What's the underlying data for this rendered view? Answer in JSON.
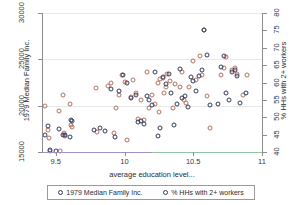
{
  "chart_data": {
    "type": "scatter",
    "title": "",
    "xlabel": "average education level...",
    "ylabel": "1979 Median Family Inc.",
    "ylabel_right": "% HHs with 2+ workers",
    "xlim": [
      9.4,
      11.0
    ],
    "ylim_left": [
      15000,
      30000
    ],
    "ylim_right": [
      40,
      80
    ],
    "grid": true,
    "legend_position": "below-axis",
    "xticks": [
      "9.5",
      "10",
      "10.5",
      "11"
    ],
    "xtick_values": [
      9.5,
      10,
      10.5,
      11
    ],
    "yticks_left": [
      "15000",
      "20000",
      "25000",
      "30000"
    ],
    "ytick_values_left": [
      15000,
      20000,
      25000,
      30000
    ],
    "yticks_right": [
      "40",
      "45",
      "50",
      "55",
      "60",
      "65",
      "70",
      "75",
      "80"
    ],
    "ytick_values_right": [
      40,
      45,
      50,
      55,
      60,
      65,
      70,
      75,
      80
    ],
    "series": [
      {
        "name": "1979 Median Family Inc.",
        "color": "#b5705c",
        "axis": "left",
        "marker": "open-circle",
        "points": [
          [
            9.42,
            19950
          ],
          [
            9.44,
            17400
          ],
          [
            9.45,
            16500
          ],
          [
            9.46,
            15100
          ],
          [
            9.52,
            19400
          ],
          [
            9.53,
            15100
          ],
          [
            9.55,
            21200
          ],
          [
            9.56,
            17000
          ],
          [
            9.57,
            16700
          ],
          [
            9.6,
            20200
          ],
          [
            9.61,
            17900
          ],
          [
            9.62,
            17700
          ],
          [
            9.79,
            21900
          ],
          [
            9.8,
            17200
          ],
          [
            9.88,
            22100
          ],
          [
            9.9,
            22400
          ],
          [
            9.92,
            17100
          ],
          [
            9.94,
            19700
          ],
          [
            9.96,
            21200
          ],
          [
            9.98,
            23300
          ],
          [
            10.0,
            22600
          ],
          [
            10.02,
            16300
          ],
          [
            10.05,
            20900
          ],
          [
            10.06,
            22800
          ],
          [
            10.08,
            21400
          ],
          [
            10.1,
            18600
          ],
          [
            10.12,
            20600
          ],
          [
            10.14,
            18500
          ],
          [
            10.16,
            23600
          ],
          [
            10.18,
            19700
          ],
          [
            10.2,
            21200
          ],
          [
            10.22,
            20200
          ],
          [
            10.24,
            22500
          ],
          [
            10.25,
            19300
          ],
          [
            10.26,
            22900
          ],
          [
            10.28,
            23000
          ],
          [
            10.29,
            21400
          ],
          [
            10.3,
            22000
          ],
          [
            10.31,
            23400
          ],
          [
            10.33,
            22700
          ],
          [
            10.35,
            19700
          ],
          [
            10.37,
            22300
          ],
          [
            10.4,
            22000
          ],
          [
            10.42,
            23600
          ],
          [
            10.43,
            20600
          ],
          [
            10.45,
            20300
          ],
          [
            10.47,
            22000
          ],
          [
            10.5,
            24800
          ],
          [
            10.52,
            22800
          ],
          [
            10.55,
            25400
          ],
          [
            10.56,
            23300
          ],
          [
            10.58,
            28200
          ],
          [
            10.6,
            21000
          ],
          [
            10.62,
            17600
          ],
          [
            10.7,
            23300
          ],
          [
            10.72,
            24100
          ],
          [
            10.74,
            25200
          ],
          [
            10.78,
            23800
          ],
          [
            10.8,
            24100
          ],
          [
            10.82,
            23400
          ],
          [
            10.86,
            21200
          ],
          [
            10.89,
            23300
          ]
        ]
      },
      {
        "name": "% HHs with 2+ workers",
        "color": "#2f3a5c",
        "axis": "right",
        "marker": "open-circle",
        "points": [
          [
            9.42,
            45.0
          ],
          [
            9.44,
            47.5
          ],
          [
            9.46,
            40.5
          ],
          [
            9.5,
            40.3
          ],
          [
            9.52,
            46.5
          ],
          [
            9.55,
            44.8
          ],
          [
            9.57,
            45.0
          ],
          [
            9.6,
            44.2
          ],
          [
            9.61,
            49.3
          ],
          [
            9.62,
            49.0
          ],
          [
            9.78,
            46.4
          ],
          [
            9.82,
            47.0
          ],
          [
            9.86,
            46.0
          ],
          [
            9.9,
            58.2
          ],
          [
            9.93,
            44.2
          ],
          [
            9.96,
            57.5
          ],
          [
            9.99,
            62.3
          ],
          [
            10.02,
            59.8
          ],
          [
            10.05,
            55.6
          ],
          [
            10.08,
            56.5
          ],
          [
            10.1,
            48.5
          ],
          [
            10.12,
            48.8
          ],
          [
            10.14,
            48.0
          ],
          [
            10.16,
            56.2
          ],
          [
            10.18,
            55.0
          ],
          [
            10.2,
            53.5
          ],
          [
            10.22,
            63.0
          ],
          [
            10.24,
            44.5
          ],
          [
            10.26,
            47.0
          ],
          [
            10.28,
            61.5
          ],
          [
            10.3,
            59.5
          ],
          [
            10.32,
            62.5
          ],
          [
            10.34,
            57.0
          ],
          [
            10.36,
            47.8
          ],
          [
            10.38,
            53.8
          ],
          [
            10.4,
            64.0
          ],
          [
            10.42,
            55.4
          ],
          [
            10.44,
            56.0
          ],
          [
            10.46,
            53.0
          ],
          [
            10.48,
            61.5
          ],
          [
            10.5,
            60.5
          ],
          [
            10.52,
            57.5
          ],
          [
            10.54,
            62.0
          ],
          [
            10.56,
            63.5
          ],
          [
            10.58,
            75.0
          ],
          [
            10.6,
            68.0
          ],
          [
            10.62,
            53.5
          ],
          [
            10.68,
            53.8
          ],
          [
            10.7,
            64.5
          ],
          [
            10.72,
            67.5
          ],
          [
            10.74,
            57.0
          ],
          [
            10.76,
            55.0
          ],
          [
            10.78,
            63.0
          ],
          [
            10.8,
            63.5
          ],
          [
            10.82,
            62.0
          ],
          [
            10.84,
            54.0
          ],
          [
            10.88,
            57.0
          ]
        ]
      }
    ]
  },
  "legend": {
    "entries": [
      {
        "label": "1979 Median Family Inc.",
        "color": "#2f3a5c"
      },
      {
        "label": "% HHs with 2+ workers",
        "color": "#2f3a5c"
      }
    ]
  }
}
